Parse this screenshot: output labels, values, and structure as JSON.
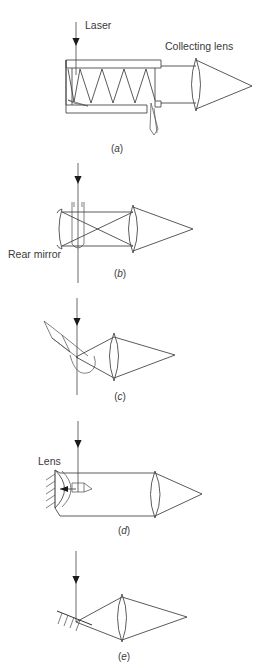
{
  "figure": {
    "background_color": "#ffffff",
    "line_color": "#4a4a4a",
    "text_color": "#3a3a3a",
    "labels": {
      "laser": "Laser",
      "collecting_lens": "Collecting lens",
      "rear_mirror": "Rear mirror",
      "lens": "Lens"
    },
    "panels": [
      {
        "id": "a",
        "caption_open": "(",
        "caption_letter": "a",
        "caption_close": ")"
      },
      {
        "id": "b",
        "caption_open": "(",
        "caption_letter": "b",
        "caption_close": ")"
      },
      {
        "id": "c",
        "caption_open": "(",
        "caption_letter": "c",
        "caption_close": ")"
      },
      {
        "id": "d",
        "caption_open": "(",
        "caption_letter": "d",
        "caption_close": ")"
      },
      {
        "id": "e",
        "caption_open": "(",
        "caption_letter": "e",
        "caption_close": ")"
      }
    ]
  }
}
